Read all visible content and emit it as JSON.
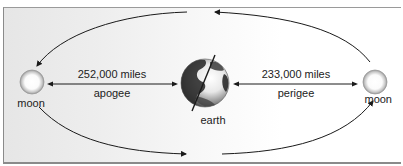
{
  "diagram": {
    "bodies": {
      "left_moon": {
        "label": "moon"
      },
      "right_moon": {
        "label": "moon"
      },
      "earth": {
        "label": "earth"
      }
    },
    "distances": {
      "apogee": {
        "value": "252,000 miles",
        "label": "apogee"
      },
      "perigee": {
        "value": "233,000 miles",
        "label": "perigee"
      }
    },
    "colors": {
      "line": "#1a1a1a",
      "background_left": "#e6e6e6",
      "background_right": "#ffffff",
      "frame": "#8a8a8a"
    }
  }
}
